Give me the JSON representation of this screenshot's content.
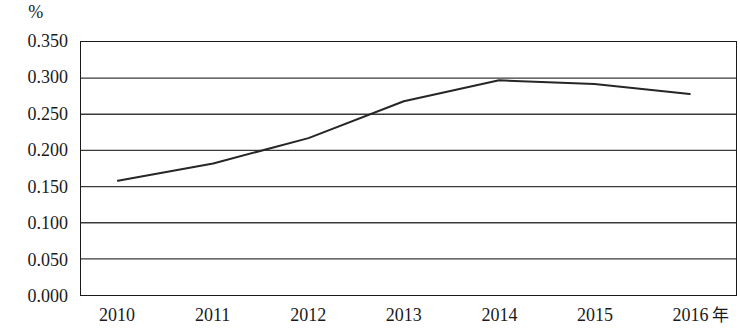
{
  "chart_data": {
    "type": "line",
    "title": "",
    "subtitle": "",
    "xlabel": "年",
    "ylabel": "%",
    "categories": [
      "2010",
      "2011",
      "2012",
      "2013",
      "2014",
      "2015",
      "2016"
    ],
    "x": [
      2010,
      2011,
      2012,
      2013,
      2014,
      2015,
      2016
    ],
    "series": [
      {
        "name": "",
        "values": [
          0.158,
          0.182,
          0.217,
          0.268,
          0.297,
          0.292,
          0.278
        ]
      }
    ],
    "ylim": [
      0.0,
      0.35
    ],
    "ytick_step": 0.05,
    "ytick_labels": [
      "0.000",
      "0.050",
      "0.100",
      "0.150",
      "0.200",
      "0.250",
      "0.300",
      "0.350"
    ],
    "ytick_values": [
      0.0,
      0.05,
      0.1,
      0.15,
      0.2,
      0.25,
      0.3,
      0.35
    ],
    "grid": "horizontal",
    "legend": "none",
    "line_color": "#262626",
    "frame_color": "#1a1a1a",
    "gridline_color": "#3a3a3a",
    "background_color": "#ffffff",
    "annotations": []
  }
}
